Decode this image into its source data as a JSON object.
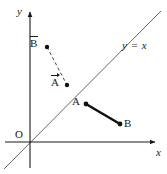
{
  "figure": {
    "width": 167,
    "height": 174,
    "background": "#ffffff",
    "ink_color": "#1a1a1a",
    "line_color": "#555555"
  },
  "axes": {
    "x_label": "x",
    "y_label": "y",
    "origin_label": "O",
    "x_axis": {
      "x1": 5,
      "y1": 142,
      "x2": 155,
      "y2": 142
    },
    "y_axis": {
      "x1": 30,
      "y1": 168,
      "x2": 30,
      "y2": 12
    },
    "x_label_pos": {
      "x": 156,
      "y": 147
    },
    "y_label_pos": {
      "x": 17,
      "y": 6
    },
    "origin_label_pos": {
      "x": 15,
      "y": 129
    }
  },
  "identity_line": {
    "label": "y = x",
    "label_pos": {
      "x": 122,
      "y": 40
    },
    "x1": 4,
    "y1": 169,
    "x2": 161,
    "y2": 11,
    "color": "#666666",
    "width": 1
  },
  "reflected_segment": {
    "style": "dashed",
    "color": "#444444",
    "width": 1,
    "start": {
      "name": "B-bar",
      "label": "B",
      "overline": true,
      "arrow": false,
      "x": 47,
      "y": 47,
      "label_x": 30,
      "label_y": 38
    },
    "end": {
      "name": "A-bar",
      "label": "A",
      "overline": true,
      "arrow": true,
      "x": 67,
      "y": 85,
      "label_x": 51,
      "label_y": 77
    }
  },
  "original_segment": {
    "style": "solid",
    "color": "#111111",
    "width": 2.6,
    "start": {
      "name": "A",
      "label": "A",
      "x": 86,
      "y": 104,
      "label_x": 72,
      "label_y": 96
    },
    "end": {
      "name": "B",
      "label": "B",
      "x": 120,
      "y": 124,
      "label_x": 124,
      "label_y": 118
    }
  },
  "point_marker": {
    "radius": 2.2,
    "color": "#111111"
  }
}
